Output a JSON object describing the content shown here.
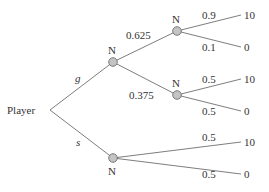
{
  "diagram": {
    "type": "game-tree",
    "root": {
      "label": "Player"
    },
    "root_actions": [
      {
        "label": "g",
        "child": "N"
      },
      {
        "label": "s",
        "child": "N"
      }
    ],
    "nature_label": "N",
    "nodes": {
      "g_node": {
        "label": "N",
        "branches": [
          {
            "prob": "0.625",
            "child": "N"
          },
          {
            "prob": "0.375",
            "child": "N"
          }
        ]
      },
      "g_top": {
        "label": "N",
        "branches": [
          {
            "prob": "0.9",
            "payoff": "10"
          },
          {
            "prob": "0.1",
            "payoff": "0"
          }
        ]
      },
      "g_mid": {
        "label": "N",
        "branches": [
          {
            "prob": "0.5",
            "payoff": "10"
          },
          {
            "prob": "0.5",
            "payoff": "0"
          }
        ]
      },
      "s_node": {
        "label": "N",
        "branches": [
          {
            "prob": "0.5",
            "payoff": "10"
          },
          {
            "prob": "0.5",
            "payoff": "0"
          }
        ]
      }
    },
    "colors": {
      "edge": "#6e6e6e",
      "node_fill": "#c4c4c4",
      "text": "#333333"
    }
  }
}
